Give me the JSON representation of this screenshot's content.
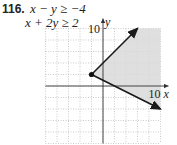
{
  "problem": {
    "number": "116.",
    "inequalities": [
      "x − y ≥ −4",
      "x + 2y ≥ 2"
    ]
  },
  "chart_data": {
    "type": "area",
    "title": "",
    "inequalities": [
      "x - y >= -4",
      "x + 2y >= 2"
    ],
    "xlabel": "x",
    "ylabel": "y",
    "xlim": [
      -10,
      10
    ],
    "ylim": [
      -10,
      10
    ],
    "grid": true,
    "grid_step": 2,
    "tick_labels": {
      "x": [
        "10"
      ],
      "y": [
        "10"
      ]
    },
    "vertex": {
      "x": -2,
      "y": 2
    },
    "boundary_rays": [
      {
        "line": "y = x + 4",
        "from": [
          -2,
          2
        ],
        "to": [
          6,
          10
        ],
        "style": "solid",
        "arrow": true
      },
      {
        "line": "y = (2 - x) / 2",
        "from": [
          -2,
          2
        ],
        "to": [
          10,
          -4
        ],
        "style": "solid",
        "arrow": true
      }
    ],
    "shaded_region_polygon": [
      [
        -2,
        2
      ],
      [
        6,
        10
      ],
      [
        10,
        10
      ],
      [
        10,
        -4
      ]
    ],
    "shade_color": "#d9d9d9",
    "line_color": "#1a1a1a"
  },
  "axis_labels": {
    "x": "x",
    "y": "y",
    "x_tick": "10",
    "y_tick": "10"
  }
}
